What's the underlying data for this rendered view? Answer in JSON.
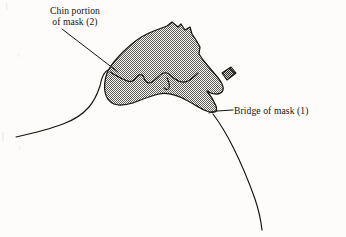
{
  "figure": {
    "background_color": "#fdfcfa",
    "ink_color": "#17140f",
    "mask_fill_color": "#9d9d9d",
    "mask_halftone": "fine checkerboard screen, approximately 50 percent gray",
    "nose_clip_color": "#2a2724"
  },
  "labels": {
    "chin": {
      "line1": "Chin portion",
      "line2": "of mask (2)",
      "callout_number": "2",
      "leader_from_x": 62,
      "leader_from_y": 29,
      "leader_to_x": 118,
      "leader_to_y": 72
    },
    "bridge": {
      "line1": "Bridge of mask (1)",
      "callout_number": "1",
      "leader_from_x": 233,
      "leader_from_y": 110,
      "leader_to_x": 217,
      "leader_to_y": 111
    }
  },
  "parts": {
    "head_profile": "thin black contour of face and neck in profile",
    "mask_body": "stippled gray mask covering chin, mouth and nose bridge",
    "chin_contour": "internal undulating line across lower mask",
    "nose_clip": "small dark rectangular tab at upper right of mask"
  }
}
